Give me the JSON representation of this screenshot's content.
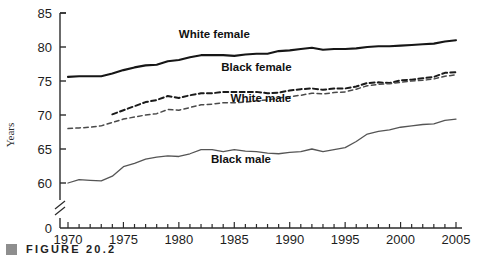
{
  "figure": {
    "caption_marker": "square-bullet",
    "caption_text": "FIGURE 20.2"
  },
  "chart_data": {
    "type": "line",
    "title": "",
    "subtitle": "",
    "xlabel": "",
    "ylabel": "Years",
    "xlim": [
      1970,
      2005
    ],
    "ylim": [
      58.5,
      85
    ],
    "y_axis_break": true,
    "y_break_label": "0",
    "grid": false,
    "legend": "inline-annotations",
    "y_ticks": [
      60,
      65,
      70,
      75,
      80,
      85
    ],
    "y_tick_labels": [
      "60",
      "65",
      "70",
      "75",
      "80",
      "85"
    ],
    "x_ticks": [
      1970,
      1975,
      1980,
      1985,
      1990,
      1995,
      2000,
      2005
    ],
    "x_tick_labels": [
      "1970",
      "1975",
      "1980",
      "1985",
      "1990",
      "1995",
      "2000",
      "2005"
    ],
    "x_minor_tick_step": 1,
    "colors": {
      "white_female": "#161616",
      "black_female": "#1a1a1a",
      "white_male": "#4a4a4a",
      "black_male": "#555555",
      "axis": "#2b2b2b"
    },
    "series": [
      {
        "name": "White female",
        "label": "White female",
        "style": "solid-thick",
        "color": "#161616",
        "label_pos": {
          "x": 1983.2,
          "y": 81.3
        },
        "x": [
          1970,
          1971,
          1972,
          1973,
          1974,
          1975,
          1976,
          1977,
          1978,
          1979,
          1980,
          1981,
          1982,
          1983,
          1984,
          1985,
          1986,
          1987,
          1988,
          1989,
          1990,
          1991,
          1992,
          1993,
          1994,
          1995,
          1996,
          1997,
          1998,
          1999,
          2000,
          2001,
          2002,
          2003,
          2004,
          2005
        ],
        "values": [
          75.6,
          75.7,
          75.7,
          75.7,
          76.1,
          76.6,
          77.0,
          77.3,
          77.4,
          77.9,
          78.1,
          78.5,
          78.8,
          78.8,
          78.8,
          78.7,
          78.9,
          79.0,
          79.0,
          79.4,
          79.5,
          79.7,
          79.9,
          79.6,
          79.7,
          79.7,
          79.8,
          80.0,
          80.1,
          80.1,
          80.2,
          80.3,
          80.4,
          80.5,
          80.8,
          81.0
        ]
      },
      {
        "name": "Black female",
        "label": "Black female",
        "style": "dashed-bold",
        "color": "#1a1a1a",
        "label_pos": {
          "x": 1987.0,
          "y": 76.4
        },
        "x": [
          1974,
          1975,
          1976,
          1977,
          1978,
          1979,
          1980,
          1981,
          1982,
          1983,
          1984,
          1985,
          1986,
          1987,
          1988,
          1989,
          1990,
          1991,
          1992,
          1993,
          1994,
          1995,
          1996,
          1997,
          1998,
          1999,
          2000,
          2001,
          2002,
          2003,
          2004,
          2005
        ],
        "values": [
          70.1,
          70.7,
          71.3,
          71.9,
          72.2,
          72.8,
          72.5,
          72.9,
          73.2,
          73.2,
          73.4,
          73.4,
          73.4,
          73.4,
          73.2,
          73.3,
          73.6,
          73.8,
          73.9,
          73.7,
          73.9,
          73.9,
          74.2,
          74.7,
          74.8,
          74.7,
          75.1,
          75.2,
          75.4,
          75.6,
          76.2,
          76.3
        ]
      },
      {
        "name": "White male",
        "label": "White male",
        "style": "dashed-light",
        "color": "#4a4a4a",
        "label_pos": {
          "x": 1987.4,
          "y": 71.9
        },
        "x": [
          1970,
          1971,
          1972,
          1973,
          1974,
          1975,
          1976,
          1977,
          1978,
          1979,
          1980,
          1981,
          1982,
          1983,
          1984,
          1985,
          1986,
          1987,
          1988,
          1989,
          1990,
          1991,
          1992,
          1993,
          1994,
          1995,
          1996,
          1997,
          1998,
          1999,
          2000,
          2001,
          2002,
          2003,
          2004,
          2005
        ],
        "values": [
          68.0,
          68.1,
          68.2,
          68.4,
          68.9,
          69.4,
          69.7,
          70.0,
          70.2,
          70.8,
          70.7,
          71.1,
          71.5,
          71.6,
          71.8,
          71.8,
          71.9,
          72.1,
          72.2,
          72.5,
          72.7,
          72.9,
          73.2,
          73.1,
          73.3,
          73.4,
          73.8,
          74.3,
          74.5,
          74.6,
          74.8,
          75.0,
          75.1,
          75.3,
          75.7,
          75.9
        ]
      },
      {
        "name": "Black male",
        "label": "Black male",
        "style": "solid-thin",
        "color": "#555555",
        "label_pos": {
          "x": 1985.6,
          "y": 63.0
        },
        "x": [
          1970,
          1971,
          1972,
          1973,
          1974,
          1975,
          1976,
          1977,
          1978,
          1979,
          1980,
          1981,
          1982,
          1983,
          1984,
          1985,
          1986,
          1987,
          1988,
          1989,
          1990,
          1991,
          1992,
          1993,
          1994,
          1995,
          1996,
          1997,
          1998,
          1999,
          2000,
          2001,
          2002,
          2003,
          2004,
          2005
        ],
        "values": [
          60.0,
          60.5,
          60.4,
          60.3,
          61.0,
          62.4,
          62.9,
          63.5,
          63.8,
          64.0,
          63.9,
          64.3,
          64.9,
          64.9,
          64.6,
          64.9,
          64.7,
          64.6,
          64.4,
          64.3,
          64.5,
          64.6,
          65.0,
          64.6,
          64.9,
          65.2,
          66.1,
          67.2,
          67.6,
          67.8,
          68.2,
          68.4,
          68.6,
          68.7,
          69.2,
          69.4
        ]
      }
    ]
  }
}
